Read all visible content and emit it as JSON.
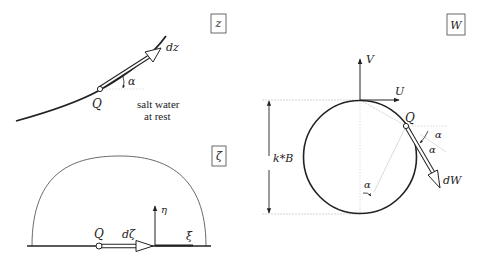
{
  "panels": {
    "z": {
      "box_label": "z",
      "point_label": "Q",
      "vector_label": "dz",
      "angle_label": "α",
      "annotation_line1": "salt water",
      "annotation_line2": "at rest"
    },
    "zeta": {
      "box_label": "ζ",
      "point_label": "Q",
      "vector_label": "dζ",
      "vertical_axis_label": "η",
      "horizontal_axis_label": "ξ"
    },
    "W": {
      "box_label": "W",
      "point_label": "Q",
      "vector_label": "dW",
      "vertical_axis_label": "V",
      "horizontal_axis_label": "U",
      "angle_label_1": "α",
      "angle_label_2": "α",
      "angle_label_3": "α",
      "dimension_label": "k*B"
    }
  },
  "colors": {
    "ink": "#222222",
    "guide": "#c8c8c8",
    "background": "#ffffff"
  }
}
